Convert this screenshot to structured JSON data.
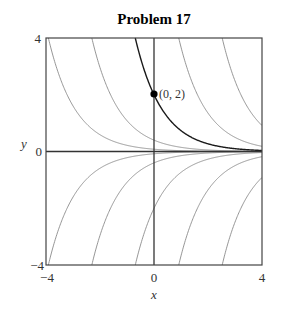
{
  "chart_data": {
    "type": "line",
    "title": "Problem 17",
    "xlabel": "x",
    "ylabel": "y",
    "xlim": [
      -4,
      4
    ],
    "ylim": [
      -4,
      4
    ],
    "grid": false,
    "legend": null,
    "xticks": [
      -4,
      0,
      4
    ],
    "xtick_labels": [
      "−4",
      "0",
      "4"
    ],
    "yticks": [
      -4,
      0,
      4
    ],
    "ytick_labels": [
      "−4",
      "0",
      "4"
    ],
    "series": [
      {
        "name": "C=0.08",
        "formula": "0.08*exp(-x)",
        "C": 0.08,
        "highlight": false
      },
      {
        "name": "C=0.4",
        "formula": "0.4*exp(-x)",
        "C": 0.4,
        "highlight": false
      },
      {
        "name": "C=2 (through (0,2))",
        "formula": "2*exp(-x)",
        "C": 2,
        "highlight": true
      },
      {
        "name": "C=10",
        "formula": "10*exp(-x)",
        "C": 10,
        "highlight": false
      },
      {
        "name": "C=50",
        "formula": "50*exp(-x)",
        "C": 50,
        "highlight": false
      },
      {
        "name": "C=-0.08",
        "formula": "-0.08*exp(-x)",
        "C": -0.08,
        "highlight": false
      },
      {
        "name": "C=-0.4",
        "formula": "-0.4*exp(-x)",
        "C": -0.4,
        "highlight": false
      },
      {
        "name": "C=-2",
        "formula": "-2*exp(-x)",
        "C": -2,
        "highlight": false
      },
      {
        "name": "C=-10",
        "formula": "-10*exp(-x)",
        "C": -10,
        "highlight": false
      },
      {
        "name": "C=-50",
        "formula": "-50*exp(-x)",
        "C": -50,
        "highlight": false
      }
    ],
    "annotations": [
      {
        "type": "point",
        "x": 0,
        "y": 2,
        "label": "(0, 2)"
      }
    ],
    "colors": {
      "curve": "#8a8a8a",
      "highlight_curve": "#1a1a1a",
      "axis": "#333333",
      "frame": "#444444",
      "point": "#000000"
    }
  }
}
